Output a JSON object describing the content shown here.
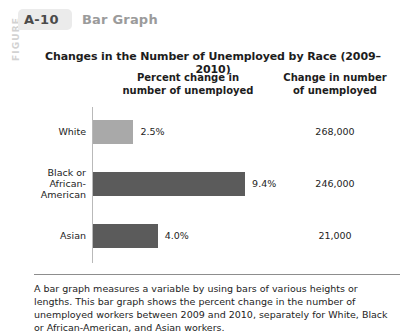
{
  "figure": {
    "vertical_label": "FIGURE",
    "number": "A-10",
    "kind": "Bar Graph"
  },
  "chart_data": {
    "type": "bar",
    "orientation": "horizontal",
    "title": "Changes in the Number of Unemployed by Race (2009–2010)",
    "xlabel": "",
    "ylabel": "",
    "grid": false,
    "legend": "none",
    "columns": [
      "Percent change in number of unemployed",
      "Change in number of unemployed"
    ],
    "column_headers": [
      {
        "line1": "Percent change in",
        "line2": "number of unemployed"
      },
      {
        "line1": "Change in number",
        "line2": "of unemployed"
      }
    ],
    "categories": [
      "White",
      "Black or African-American",
      "Asian"
    ],
    "values": [
      2.5,
      9.4,
      4.0
    ],
    "value_labels": [
      "2.5%",
      "9.4%",
      "4.0%"
    ],
    "secondary_values": [
      268000,
      21000,
      246000
    ],
    "secondary_labels": [
      "268,000",
      "246,000",
      "21,000"
    ],
    "bar_colors": [
      "#a9a9a9",
      "#5b5b5b",
      "#5b5b5b"
    ],
    "xlim": [
      0,
      11
    ],
    "rows": [
      {
        "label_lines": [
          "White"
        ],
        "percent": "2.5%",
        "value": 2.5,
        "count": "268,000",
        "color": "#a9a9a9"
      },
      {
        "label_lines": [
          "Black or",
          "African-",
          "American"
        ],
        "percent": "9.4%",
        "value": 9.4,
        "count": "246,000",
        "color": "#5b5b5b"
      },
      {
        "label_lines": [
          "Asian"
        ],
        "percent": "4.0%",
        "value": 4.0,
        "count": "21,000",
        "color": "#5b5b5b"
      }
    ]
  },
  "caption": {
    "text": "A bar graph measures a variable by using bars of various heights or lengths. This bar graph shows the percent change in the number of unemployed workers between 2009 and 2010, separately for White, Black or African-American, and Asian workers."
  }
}
